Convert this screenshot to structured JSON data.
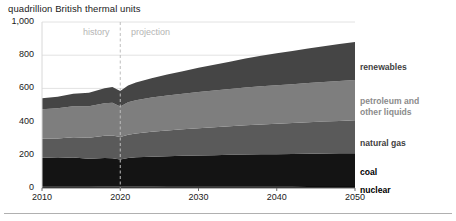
{
  "chart_data": {
    "type": "area",
    "stacked": true,
    "title": "quadrillion British thermal units",
    "xlabel": "",
    "ylabel": "",
    "xlim": [
      2010,
      2050
    ],
    "ylim": [
      0,
      1000
    ],
    "grid": true,
    "legend_position": "right-outside",
    "x_ticks": [
      "2010",
      "2020",
      "2030",
      "2040",
      "2050"
    ],
    "y_ticks": [
      "0",
      "200",
      "400",
      "600",
      "800",
      "1,000"
    ],
    "x": [
      2010,
      2012,
      2014,
      2016,
      2018,
      2019,
      2020,
      2021,
      2022,
      2024,
      2026,
      2028,
      2030,
      2032,
      2034,
      2036,
      2038,
      2040,
      2042,
      2044,
      2046,
      2048,
      2050
    ],
    "series": [
      {
        "name": "nuclear",
        "color": "#0d0d0d",
        "values": [
          8,
          8,
          8,
          8,
          9,
          9,
          9,
          9,
          9,
          9,
          10,
          10,
          10,
          10,
          10,
          11,
          11,
          11,
          11,
          12,
          12,
          12,
          12
        ]
      },
      {
        "name": "coal",
        "color": "#141414",
        "values": [
          175,
          172,
          176,
          168,
          172,
          170,
          162,
          172,
          176,
          180,
          182,
          184,
          186,
          188,
          190,
          191,
          192,
          193,
          194,
          195,
          196,
          197,
          198
        ]
      },
      {
        "name": "natural gas",
        "color": "#5a5a5a",
        "values": [
          114,
          118,
          122,
          126,
          134,
          137,
          136,
          140,
          144,
          150,
          155,
          160,
          164,
          168,
          172,
          176,
          180,
          183,
          186,
          189,
          192,
          195,
          198
        ]
      },
      {
        "name": "petroleum and other liquids",
        "color": "#7e7e7e",
        "values": [
          178,
          182,
          186,
          190,
          196,
          198,
          184,
          196,
          200,
          206,
          210,
          214,
          218,
          221,
          224,
          227,
          230,
          232,
          234,
          236,
          238,
          240,
          242
        ]
      },
      {
        "name": "renewables",
        "color": "#454545",
        "values": [
          65,
          70,
          76,
          82,
          90,
          94,
          94,
          100,
          106,
          116,
          126,
          136,
          146,
          156,
          165,
          175,
          184,
          193,
          201,
          209,
          216,
          223,
          230
        ]
      }
    ],
    "annotations": [
      {
        "name": "history",
        "label": "history",
        "x": 2020,
        "side": "left"
      },
      {
        "name": "projection",
        "label": "projection",
        "x": 2020,
        "side": "right"
      }
    ],
    "divider": {
      "x": 2020,
      "style": "dashed",
      "color": "#bdbdbd"
    }
  },
  "labels": {
    "renewables": "renewables",
    "petroleum": "petroleum and other liquids",
    "petroleum_line1": "petroleum and",
    "petroleum_line2": "other liquids",
    "natural_gas": "natural gas",
    "coal": "coal",
    "nuclear": "nuclear"
  }
}
